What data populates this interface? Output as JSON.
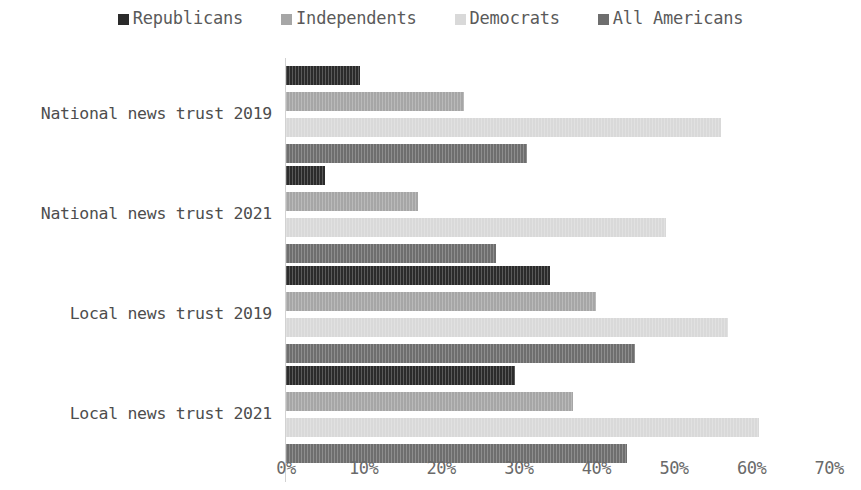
{
  "chart_data": {
    "type": "bar",
    "orientation": "horizontal",
    "title": "",
    "xlabel": "",
    "ylabel": "",
    "xlim": [
      0,
      70
    ],
    "xtick_labels": [
      "0%",
      "10%",
      "20%",
      "30%",
      "40%",
      "50%",
      "60%",
      "70%"
    ],
    "xtick_values": [
      0,
      10,
      20,
      30,
      40,
      50,
      60,
      70
    ],
    "grid": false,
    "legend_position": "top-center",
    "value_suffix": "%",
    "categories": [
      "National news trust 2019",
      "National news trust 2021",
      "Local news trust 2019",
      "Local news trust 2021"
    ],
    "series": [
      {
        "name": "Republicans",
        "color": "#2b2b2b",
        "values": [
          9.5,
          5.0,
          34.0,
          29.5
        ]
      },
      {
        "name": "Independents",
        "color": "#a6a6a6",
        "values": [
          23.0,
          17.0,
          40.0,
          37.0
        ]
      },
      {
        "name": "Democrats",
        "color": "#d9d9d9",
        "values": [
          56.0,
          49.0,
          57.0,
          61.0
        ]
      },
      {
        "name": "All Americans",
        "color": "#6e6e6e",
        "values": [
          31.0,
          27.0,
          45.0,
          44.0
        ]
      }
    ]
  },
  "legend": {
    "items": [
      {
        "label": "Republicans",
        "color": "#2b2b2b"
      },
      {
        "label": "Independents",
        "color": "#a6a6a6"
      },
      {
        "label": "Democrats",
        "color": "#d9d9d9"
      },
      {
        "label": "All Americans",
        "color": "#6e6e6e"
      }
    ]
  },
  "axis": {
    "line_color": "#d2d2d2",
    "tick_text_color": "#6a6a6a",
    "category_text_color": "#4d4d4d"
  }
}
